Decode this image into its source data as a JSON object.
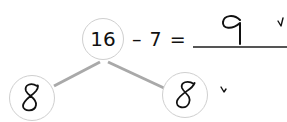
{
  "worksheet": {
    "type": "number-bond",
    "whole": "16",
    "equation": {
      "operator_text": "– 7 =",
      "answer_handwritten": "9",
      "answer_checked": true
    },
    "parts": [
      {
        "value_handwritten": "8",
        "position": "left"
      },
      {
        "value_handwritten": "8",
        "position": "right",
        "checked": true
      }
    ],
    "colors": {
      "ink": "#111111",
      "circle_border": "#cfcfcf",
      "bond_line": "#a9a9a9",
      "underline": "#555555"
    }
  }
}
